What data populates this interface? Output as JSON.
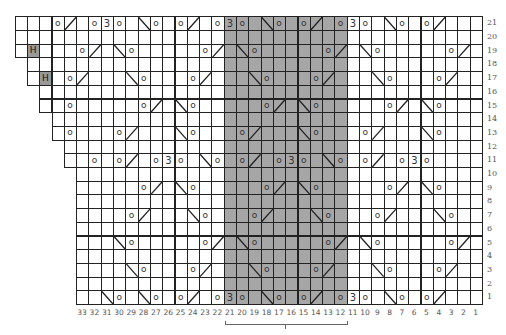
{
  "chart": {
    "cell_width": 12.3,
    "cell_height": 13.7,
    "grid_right": 482,
    "grid_bottom": 304,
    "total_columns": 38,
    "symbol_key": {
      ".": "outside-grid",
      " ": "knit",
      "o": "yarn-over",
      "/": "right-leaning-decrease",
      "\\": "left-leaning-decrease",
      "3": "three-into-three",
      "H": "highlighted-stitch"
    },
    "shaded_repeat": {
      "from_column": 21,
      "to_column": 12,
      "color": "#a6a6a6"
    },
    "rows": [
      {
        "number": 21,
        "cells": "   o/ o3o \\o o/ o3o \\o o/ o3o \\o o/   "
      },
      {
        "number": 20,
        "cells": "                                      "
      },
      {
        "number": 19,
        "cells": " H   o/ \\o     o/ \\o     o/ \\o     o/ "
      },
      {
        "number": 18,
        "cells": ".                                     "
      },
      {
        "number": 17,
        "cells": ". H o/   \\o   o/   \\o   o/   \\o   o/  "
      },
      {
        "number": 16,
        "cells": "..                                    "
      },
      {
        "number": 15,
        "cells": "..  o     o/ \\o     o/ \\o     o/ \\o   "
      },
      {
        "number": 14,
        "cells": "...                                   "
      },
      {
        "number": 13,
        "cells": "... o   o/   \\o   o/   \\o   o/   \\o  "
      },
      {
        "number": 12,
        "cells": "....                                  "
      },
      {
        "number": 11,
        "cells": "....  o o/ o3o \\o o/ o3o \\o o/ o3o    "
      },
      {
        "number": 10,
        "cells": ".....                                 "
      },
      {
        "number": 9,
        "cells": ".....     o/ \\o     o/ \\o     o/ \\o   "
      },
      {
        "number": 8,
        "cells": ".....                                 "
      },
      {
        "number": 7,
        "cells": ".....    o/   \\o   o/   \\o   o/   \\o  "
      },
      {
        "number": 6,
        "cells": ".....                                 "
      },
      {
        "number": 5,
        "cells": ".....   \\o     o/ \\o     o/ \\o     o/ "
      },
      {
        "number": 4,
        "cells": ".....                                 "
      },
      {
        "number": 3,
        "cells": ".....    \\o   o/   \\o   o/   \\o   o/  "
      },
      {
        "number": 2,
        "cells": ".....                                 "
      },
      {
        "number": 1,
        "cells": ".....  \\o \\o o/ o3o \\o o/ o3o \\o o/   "
      }
    ],
    "row_labels": [
      "21",
      "20",
      "19",
      "18",
      "17",
      "16",
      "15",
      "14",
      "13",
      "12",
      "11",
      "10",
      "9",
      "8",
      "7",
      "6",
      "5",
      "4",
      "3",
      "2",
      "1"
    ],
    "column_labels": [
      "33",
      "32",
      "31",
      "30",
      "29",
      "28",
      "27",
      "26",
      "25",
      "24",
      "23",
      "22",
      "21",
      "20",
      "19",
      "18",
      "17",
      "16",
      "15",
      "14",
      "13",
      "12",
      "11",
      "10",
      "9",
      "8",
      "7",
      "6",
      "5",
      "4",
      "3",
      "2",
      "1"
    ],
    "bracket": {
      "from_column": 21,
      "to_column": 12
    }
  }
}
